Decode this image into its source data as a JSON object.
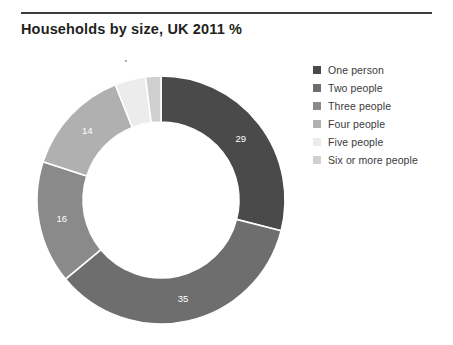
{
  "chart": {
    "title": "Households by size, UK 2011 %"
  },
  "chart_data": {
    "type": "pie",
    "variant": "donut",
    "title": "Households by size, UK 2011 %",
    "xlabel": "",
    "ylabel": "",
    "units": "%",
    "legend_position": "right",
    "grid": false,
    "start_angle_deg": 0,
    "direction": "clockwise",
    "categories": [
      "One person",
      "Two people",
      "Three people",
      "Four people",
      "Five people",
      "Six or more people"
    ],
    "values": [
      29,
      35,
      16,
      14,
      4,
      2
    ],
    "labels": [
      "29",
      "35",
      "16",
      "14",
      "4",
      "2"
    ],
    "label_placement": [
      "inside",
      "inside",
      "inside",
      "inside",
      "outside",
      "outside"
    ],
    "label_text_color": [
      "#ffffff",
      "#ffffff",
      "#ffffff",
      "#4b4b4b",
      "#3c3c3c",
      "#3c3c3c"
    ],
    "colors": [
      "#4a4a4a",
      "#6e6e6e",
      "#8a8a8a",
      "#b0b0b0",
      "#ececec",
      "#cfcfcf"
    ],
    "total": 100
  },
  "legend": {
    "items": [
      {
        "label": "One person",
        "color": "#4a4a4a"
      },
      {
        "label": "Two people",
        "color": "#6e6e6e"
      },
      {
        "label": "Three people",
        "color": "#8a8a8a"
      },
      {
        "label": "Four people",
        "color": "#b0b0b0"
      },
      {
        "label": "Five people",
        "color": "#ececec"
      },
      {
        "label": "Six or more people",
        "color": "#cfcfcf"
      }
    ]
  }
}
